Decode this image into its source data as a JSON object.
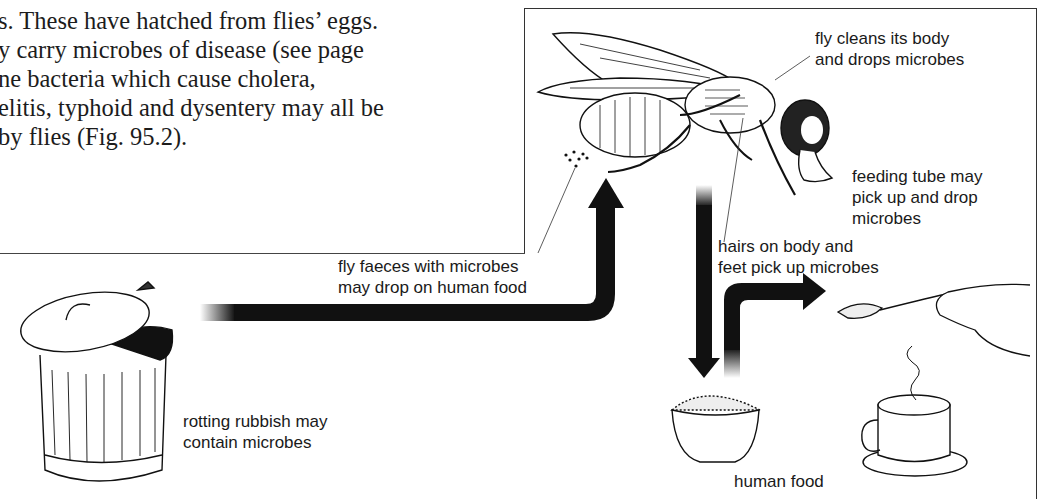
{
  "body_text": {
    "lines": [
      "s. These have hatched from flies’ eggs.",
      "y carry microbes of disease (see page",
      "ne bacteria which cause cholera,",
      "elitis, typhoid and dysentery may all be",
      "by flies (Fig. 95.2)."
    ]
  },
  "diagram": {
    "figure_ref": "Fig. 95.2",
    "labels": {
      "fly_cleans": [
        "fly cleans its body",
        "and drops microbes"
      ],
      "feeding_tube": [
        "feeding tube may",
        "pick up and drop",
        "microbes"
      ],
      "hairs": [
        "hairs on body and",
        "feet pick up microbes"
      ],
      "faeces": [
        "fly faeces with microbes",
        "may drop on human food"
      ],
      "rubbish": [
        "rotting rubbish may",
        "contain microbes"
      ],
      "human_food": "human food"
    },
    "illustrations": [
      "housefly",
      "dustbin-with-fly",
      "bowl-of-food",
      "spoon-with-sugar-in-hand",
      "teacup-on-saucer"
    ],
    "arrows": [
      {
        "from": "dustbin",
        "to": "fly",
        "path": "right-then-up"
      },
      {
        "from": "fly",
        "to": "bowl",
        "path": "down"
      },
      {
        "from": "bowl",
        "to": "spoon",
        "path": "up-then-right"
      }
    ],
    "colors": {
      "ink": "#111111",
      "paper": "#ffffff"
    }
  }
}
